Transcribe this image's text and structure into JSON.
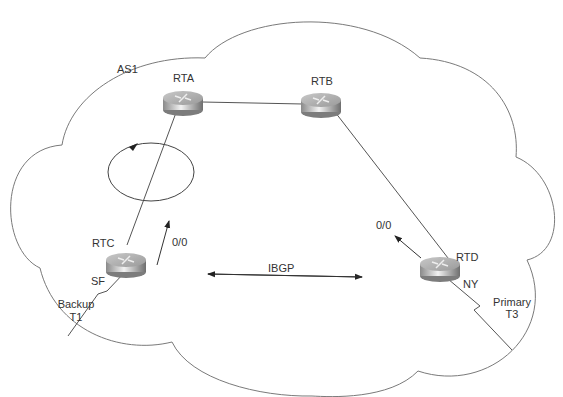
{
  "diagram": {
    "cloud_label": "AS1",
    "routers": [
      {
        "id": "RTA",
        "label": "RTA"
      },
      {
        "id": "RTB",
        "label": "RTB"
      },
      {
        "id": "RTC",
        "label": "RTC",
        "site": "SF"
      },
      {
        "id": "RTD",
        "label": "RTD",
        "site": "NY"
      }
    ],
    "links": [
      {
        "from": "RTA",
        "to": "RTB",
        "type": "ethernet"
      },
      {
        "from": "RTA",
        "to": "RTC",
        "type": "ethernet"
      },
      {
        "from": "RTB",
        "to": "RTD",
        "type": "ethernet"
      },
      {
        "from": "RTC",
        "to": "external",
        "type": "serial",
        "label_line1": "Backup",
        "label_line2": "T1"
      },
      {
        "from": "RTD",
        "to": "external",
        "type": "serial",
        "label_line1": "Primary",
        "label_line2": "T3"
      }
    ],
    "default_routes": [
      {
        "router": "RTC",
        "label": "0/0"
      },
      {
        "router": "RTD",
        "label": "0/0"
      }
    ],
    "session": {
      "label": "IBGP",
      "between": [
        "RTC",
        "RTD"
      ]
    },
    "loop_indicator": "routing-loop-circle-arrow"
  }
}
